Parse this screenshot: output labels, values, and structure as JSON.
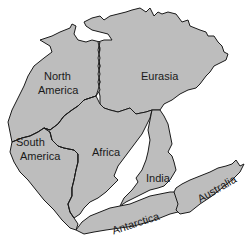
{
  "map": {
    "title": "Pangaea",
    "land_color": "#bdbdbd",
    "outline_color": "#1a1a1a",
    "background_color": "#ffffff",
    "labels": {
      "north_america": [
        "North",
        "America"
      ],
      "eurasia": "Eurasia",
      "south_america": [
        "South",
        "America"
      ],
      "africa": "Africa",
      "india": "India",
      "australia": "Australia",
      "antarctica": "Antarctica"
    }
  }
}
